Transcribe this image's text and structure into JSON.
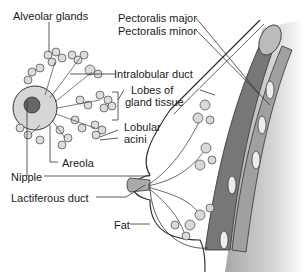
{
  "diagram": {
    "type": "anatomy",
    "labels": {
      "alveolar_glands": "Alveolar glands",
      "pectoralis_major": "Pectoralis major",
      "pectoralis_minor": "Pectoralis minor",
      "intralobular_duct": "Intralobular duct",
      "lobes_line1": "Lobes of",
      "lobes_line2": "gland tissue",
      "lobular_line1": "Lobular",
      "lobular_line2": "acini",
      "areola": "Areola",
      "nipple": "Nipple",
      "lactiferous_duct": "Lactiferous duct",
      "fat": "Fat"
    },
    "colors": {
      "line": "#333333",
      "gland_fill": "#d9d9d9",
      "muscle_dark": "#6e6e6e",
      "muscle_mid": "#9a9a9a",
      "chest_shade": "#c8c8c8",
      "areola_fill": "#cfcfcf",
      "nipple_fill": "#666666"
    }
  }
}
